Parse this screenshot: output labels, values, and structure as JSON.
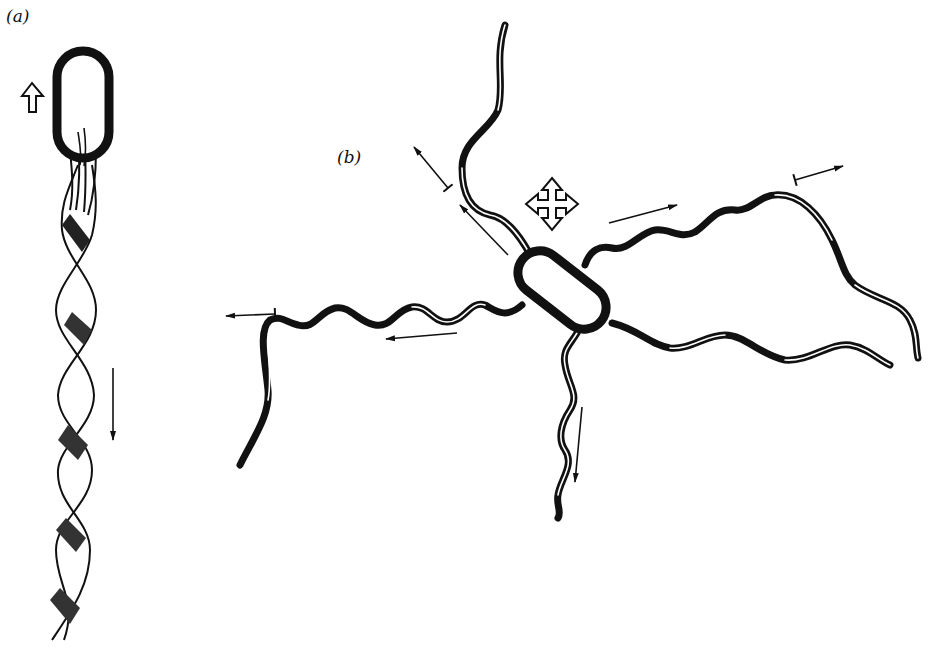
{
  "diagram": {
    "panels": [
      {
        "id": "a",
        "label": "(a)",
        "description": "Bacterium swimming (run) with flagella bundled into a single helical bundle; open arrow shows cell moving up, thin arrow shows bundle pushing down"
      },
      {
        "id": "b",
        "label": "(b)",
        "description": "Bacterium tumbling with flagella splayed apart in different directions; open four-way arrow indicates random reorientation, thin arrows show direction of each flagellum"
      }
    ],
    "colors": {
      "ink": "#111111",
      "background": "#ffffff"
    },
    "icons": {
      "run_direction": "open-up-arrow",
      "tumble_direction": "open-four-way-arrow"
    }
  }
}
